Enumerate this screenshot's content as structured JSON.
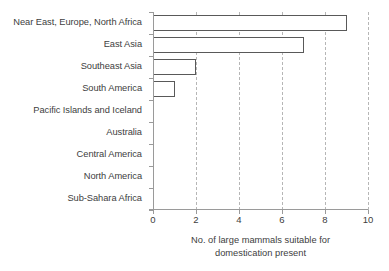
{
  "chart_data": {
    "type": "bar",
    "orientation": "horizontal",
    "title": "",
    "xlabel_lines": [
      "No. of large mammals suitable for",
      "domestication present"
    ],
    "ylabel": "",
    "categories": [
      "Near East, Europe, North Africa",
      "East Asia",
      "Southeast Asia",
      "South America",
      "Pacific Islands and Iceland",
      "Australia",
      "Central America",
      "North America",
      "Sub-Sahara Africa"
    ],
    "values": [
      9,
      7,
      2,
      1,
      0,
      0,
      0,
      0,
      0
    ],
    "xlim": [
      0,
      10
    ],
    "xticks": [
      0,
      2,
      4,
      6,
      8,
      10
    ],
    "xtick_labels": [
      "0",
      "2",
      "4",
      "6",
      "8",
      "10"
    ],
    "gridlines": [
      2,
      4,
      6,
      8,
      10
    ],
    "grid": "vertical-dashed",
    "legend": "none",
    "colors": {
      "bar_fill": "#ffffff",
      "bar_border": "#595959",
      "gridline": "#b6b6b6",
      "axis": "#9a9a9a",
      "text": "#404040",
      "background": "#ffffff"
    }
  }
}
